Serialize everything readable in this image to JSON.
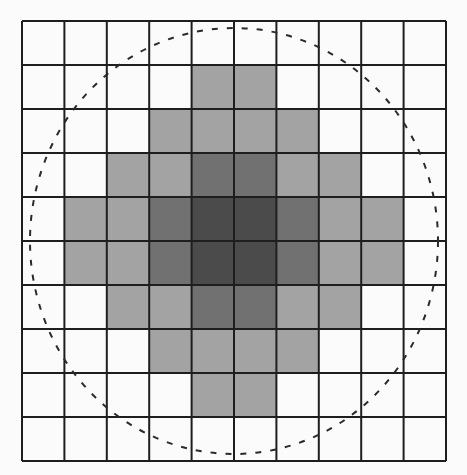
{
  "diagram": {
    "type": "grid-with-circle",
    "grid": {
      "rows": 10,
      "cols": 10,
      "left": 22,
      "top": 21,
      "width": 424,
      "height": 440,
      "line_color": "#1e1e1e",
      "line_width": 2
    },
    "shade_colors": {
      "0": "#fbfbfb",
      "1": "#a3a3a3",
      "2": "#717171",
      "3": "#4b4b4b"
    },
    "cells": [
      [
        0,
        0,
        0,
        0,
        0,
        0,
        0,
        0,
        0,
        0
      ],
      [
        0,
        0,
        0,
        0,
        1,
        1,
        0,
        0,
        0,
        0
      ],
      [
        0,
        0,
        0,
        1,
        1,
        1,
        1,
        0,
        0,
        0
      ],
      [
        0,
        0,
        1,
        1,
        2,
        2,
        1,
        1,
        0,
        0
      ],
      [
        0,
        1,
        1,
        2,
        3,
        3,
        2,
        1,
        1,
        0
      ],
      [
        0,
        1,
        1,
        2,
        3,
        3,
        2,
        1,
        1,
        0
      ],
      [
        0,
        0,
        1,
        1,
        2,
        2,
        1,
        1,
        0,
        0
      ],
      [
        0,
        0,
        0,
        1,
        1,
        1,
        1,
        0,
        0,
        0
      ],
      [
        0,
        0,
        0,
        0,
        1,
        1,
        0,
        0,
        0,
        0
      ],
      [
        0,
        0,
        0,
        0,
        0,
        0,
        0,
        0,
        0,
        0
      ]
    ],
    "circle": {
      "cx": 234,
      "cy": 241,
      "rx": 204,
      "ry": 213,
      "stroke": "#2a2a2a",
      "stroke_width": 2,
      "dash": "6 9"
    }
  }
}
